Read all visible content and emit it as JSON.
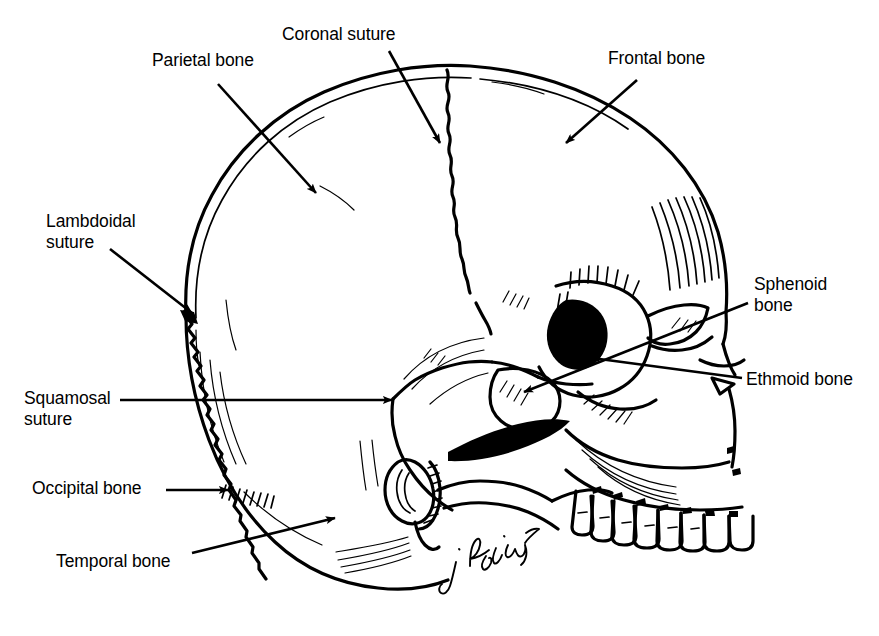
{
  "figure": {
    "background_color": "#ffffff",
    "ink_color": "#000000",
    "signature": "J. Harrington"
  },
  "labels": [
    {
      "id": "parietal-bone",
      "text": "Parietal bone",
      "x": 152,
      "y": 50,
      "align": "left"
    },
    {
      "id": "coronal-suture",
      "text": "Coronal suture",
      "x": 282,
      "y": 24,
      "align": "left"
    },
    {
      "id": "frontal-bone",
      "text": "Frontal bone",
      "x": 608,
      "y": 48,
      "align": "left"
    },
    {
      "id": "lambdoidal-suture",
      "text": "Lambdoidal\nsuture",
      "x": 46,
      "y": 211,
      "align": "left"
    },
    {
      "id": "sphenoid-bone",
      "text": "Sphenoid\nbone",
      "x": 754,
      "y": 274,
      "align": "left"
    },
    {
      "id": "squamosal-suture",
      "text": "Squamosal\nsuture",
      "x": 24,
      "y": 388,
      "align": "left"
    },
    {
      "id": "ethmoid-bone",
      "text": "Ethmoid bone",
      "x": 746,
      "y": 369,
      "align": "left"
    },
    {
      "id": "occipital-bone",
      "text": "Occipital bone",
      "x": 32,
      "y": 478,
      "align": "left"
    },
    {
      "id": "temporal-bone",
      "text": "Temporal bone",
      "x": 56,
      "y": 551,
      "align": "left"
    }
  ],
  "leaders": [
    {
      "id": "leader-parietal",
      "from": [
        218,
        84
      ],
      "to": [
        316,
        193
      ],
      "arrow": true
    },
    {
      "id": "leader-coronal",
      "from": [
        389,
        51
      ],
      "to": [
        440,
        143
      ],
      "arrow": true
    },
    {
      "id": "leader-frontal",
      "from": [
        637,
        80
      ],
      "to": [
        566,
        143
      ],
      "arrow": true
    },
    {
      "id": "leader-lambdoidal",
      "from": [
        110,
        249
      ],
      "to": [
        192,
        313
      ],
      "arrow": true
    },
    {
      "id": "leader-squamosal",
      "from": [
        120,
        400
      ],
      "to": [
        392,
        400
      ],
      "arrow": true
    },
    {
      "id": "leader-occipital",
      "from": [
        166,
        490
      ],
      "to": [
        228,
        490
      ],
      "arrow": true
    },
    {
      "id": "leader-temporal",
      "from": [
        192,
        553
      ],
      "to": [
        335,
        518
      ],
      "arrow": true
    },
    {
      "id": "leader-sphenoid",
      "from": [
        748,
        303
      ],
      "to": [
        524,
        392
      ],
      "arrow": true
    },
    {
      "id": "leader-ethmoid",
      "from": [
        742,
        378
      ],
      "to": [
        592,
        358
      ],
      "arrow": true
    }
  ],
  "anatomy": {
    "regions": [
      "calvaria",
      "parietal bone",
      "frontal bone",
      "occipital bone",
      "temporal bone",
      "sphenoid bone greater wing",
      "ethmoid bone",
      "orbit",
      "nasal aperture",
      "zygomatic arch",
      "maxilla with teeth",
      "external auditory meatus",
      "mastoid process"
    ],
    "sutures": [
      "coronal suture",
      "lambdoidal suture",
      "squamosal suture"
    ]
  }
}
